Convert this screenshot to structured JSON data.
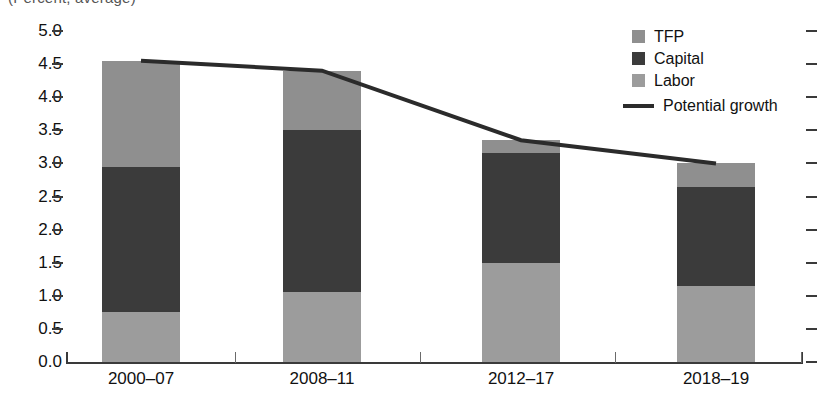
{
  "chart": {
    "subtitle_clipped": "(Percent, average)",
    "background": "#ffffff"
  },
  "legend": {
    "position": "top-right",
    "items": [
      {
        "label": "TFP",
        "color": "#8f8f8f",
        "marker": "square"
      },
      {
        "label": "Capital",
        "color": "#3b3b3b",
        "marker": "square"
      },
      {
        "label": "Labor",
        "color": "#9c9c9c",
        "marker": "square"
      },
      {
        "label": "Potential growth",
        "color": "#2b2b2b",
        "marker": "line"
      }
    ]
  },
  "axes": {
    "y_ticks": [
      "5.0",
      "4.5",
      "4.0",
      "3.5",
      "3.0",
      "2.5",
      "2.0",
      "1.5",
      "1.0",
      "0.5",
      "0.0"
    ],
    "x_ticks": [
      "2000–07",
      "2008–11",
      "2012–17",
      "2018–19"
    ]
  },
  "chart_data": {
    "type": "bar",
    "stacked": true,
    "title": "",
    "subtitle": "(Percent, average)",
    "xlabel": "",
    "ylabel": "",
    "ylim": [
      0.0,
      5.0
    ],
    "ytick_step": 0.5,
    "grid": false,
    "legend_position": "top-right",
    "categories": [
      "2000–07",
      "2008–11",
      "2012–17",
      "2018–19"
    ],
    "series": [
      {
        "name": "Labor",
        "color": "#9c9c9c",
        "values": [
          0.75,
          1.05,
          1.5,
          1.15
        ]
      },
      {
        "name": "Capital",
        "color": "#3b3b3b",
        "values": [
          2.2,
          2.45,
          1.65,
          1.5
        ]
      },
      {
        "name": "TFP",
        "color": "#8f8f8f",
        "values": [
          1.6,
          0.9,
          0.2,
          0.35
        ]
      }
    ],
    "totals": [
      4.55,
      4.4,
      3.35,
      3.0
    ],
    "overlay_line": {
      "name": "Potential growth",
      "color": "#2b2b2b",
      "values": [
        4.55,
        4.4,
        3.35,
        3.0
      ]
    }
  }
}
